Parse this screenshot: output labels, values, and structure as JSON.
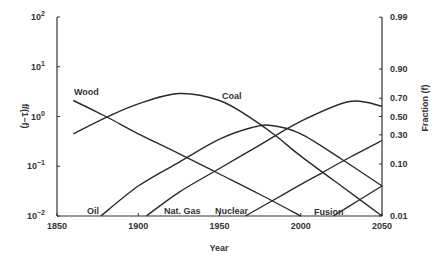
{
  "chart_data": {
    "type": "line",
    "title": "",
    "xlabel": "Year",
    "ylabel_left": "f/(1−f)",
    "ylabel_right": "Fraction (f)",
    "xlim": [
      1850,
      2050
    ],
    "ylim_log": [
      0.01,
      100
    ],
    "y_scale": "log",
    "grid": false,
    "x_ticks": [
      1850,
      1900,
      1950,
      2000,
      2050
    ],
    "y_ticks_left": [
      {
        "base": "10",
        "exp": "2",
        "value": 100
      },
      {
        "base": "10",
        "exp": "1",
        "value": 10
      },
      {
        "base": "10",
        "exp": "0",
        "value": 1
      },
      {
        "base": "10",
        "exp": "−1",
        "value": 0.1
      },
      {
        "base": "10",
        "exp": "−2",
        "value": 0.01
      }
    ],
    "y_ticks_right": [
      {
        "label": "0.99",
        "ratio": 99
      },
      {
        "label": "0.90",
        "ratio": 9
      },
      {
        "label": "0.70",
        "ratio": 2.333
      },
      {
        "label": "0.50",
        "ratio": 1
      },
      {
        "label": "0.30",
        "ratio": 0.4286
      },
      {
        "label": "0.10",
        "ratio": 0.1111
      },
      {
        "label": "0.01",
        "ratio": 0.0101
      }
    ],
    "series": [
      {
        "name": "Wood",
        "x": [
          1860,
          1880,
          1900,
          1925,
          1950,
          1975,
          2000
        ],
        "values": [
          2.1,
          1.0,
          0.45,
          0.18,
          0.07,
          0.027,
          0.01
        ]
      },
      {
        "name": "Coal",
        "x": [
          1860,
          1880,
          1900,
          1925,
          1950,
          1970,
          1985,
          2000,
          2025,
          2050
        ],
        "values": [
          0.45,
          0.95,
          1.8,
          2.9,
          2.1,
          0.9,
          0.4,
          0.16,
          0.04,
          0.01
        ]
      },
      {
        "name": "Oil",
        "x": [
          1877,
          1900,
          1925,
          1950,
          1970,
          1982,
          2000,
          2025,
          2050
        ],
        "values": [
          0.01,
          0.04,
          0.12,
          0.35,
          0.6,
          0.66,
          0.45,
          0.14,
          0.04
        ]
      },
      {
        "name": "Nat. Gas",
        "x": [
          1905,
          1925,
          1950,
          1975,
          2000,
          2030,
          2050
        ],
        "values": [
          0.01,
          0.03,
          0.09,
          0.27,
          0.8,
          2.0,
          1.6
        ]
      },
      {
        "name": "Nuclear",
        "x": [
          1966,
          1990,
          2010,
          2030,
          2050
        ],
        "values": [
          0.01,
          0.028,
          0.065,
          0.15,
          0.33
        ]
      },
      {
        "name": "Fusion",
        "x": [
          2020,
          2035,
          2050
        ],
        "values": [
          0.01,
          0.02,
          0.04
        ]
      }
    ],
    "annotations": [
      "Wood",
      "Coal",
      "Oil",
      "Nat. Gas",
      "Nuclear",
      "Fusion"
    ],
    "legend_position": "inline labels"
  },
  "labels": {
    "wood": "Wood",
    "coal": "Coal",
    "oil": "Oil",
    "natgas": "Nat. Gas",
    "nuclear": "Nuclear",
    "fusion": "Fusion",
    "x_title": "Year",
    "y_left_title": "f/(1−f)",
    "y_right_title": "Fraction (f)"
  }
}
